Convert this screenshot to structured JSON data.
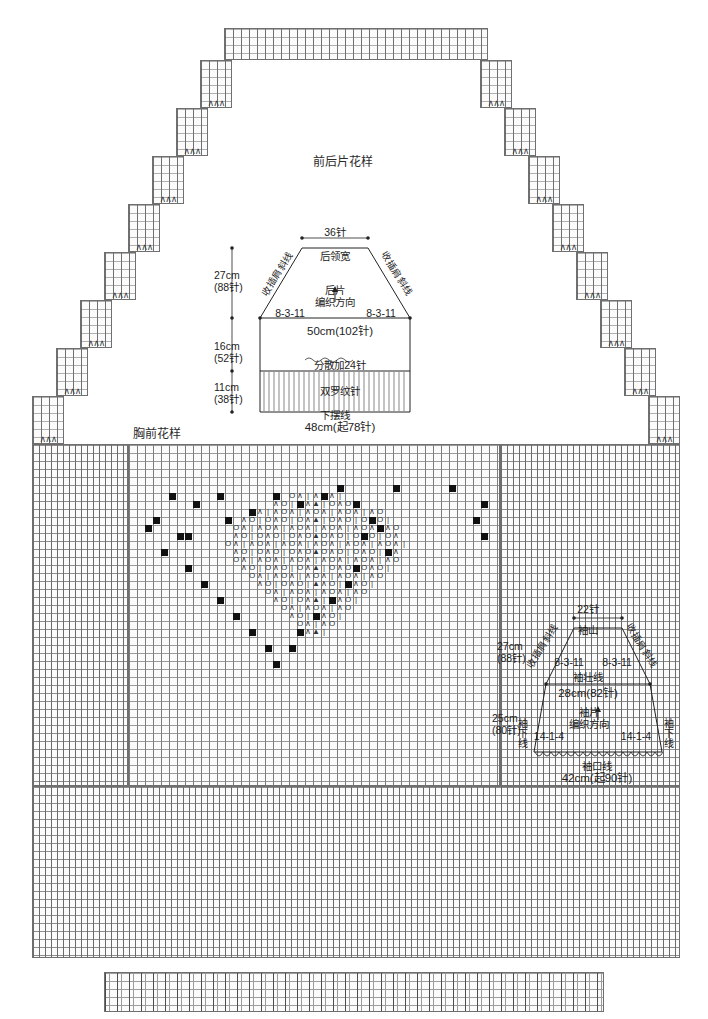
{
  "titles": {
    "body_pattern": "前后片花样",
    "chest_pattern": "胸前花样"
  },
  "back_piece": {
    "neck_width_stitches": "36针",
    "neck_label": "后领宽",
    "piece_name": "后片",
    "knit_direction": "编织方向",
    "raglan_left_label": "收插肩斜线",
    "raglan_right_label": "收插肩斜线",
    "dec_left": "8-3-11",
    "dec_right": "8-3-11",
    "chest_line": "50cm(102针)",
    "increase_note": "分散加24针",
    "rib_note": "双罗纹针",
    "hem_label": "下摆线",
    "hem_measure": "48cm(起78针)",
    "dim_yoke": "27cm\n(88针)",
    "dim_body": "16cm\n(52针)",
    "dim_rib": "11cm\n(38针)"
  },
  "sleeve": {
    "cap_top_stitches": "22针",
    "cap_label": "袖山",
    "raglan_left_label": "收插肩斜线",
    "raglan_right_label": "收插肩斜线",
    "dec_left": "8-3-11",
    "dec_right": "8-3-11",
    "upper_arm_label": "袖壮线",
    "upper_arm_measure": "28cm(82针)",
    "piece_name": "袖片",
    "knit_direction": "编织方向",
    "inc_left": "14-1-4",
    "inc_right": "14-1-4",
    "side_left_label": "袖下线",
    "side_right_label": "袖下线",
    "dim_cap": "27cm\n(88针)",
    "dim_arm": "25cm\n(80针)",
    "cuff_label": "袖口线",
    "cuff_measure": "42cm(起90针)"
  },
  "chart_data": {
    "type": "table",
    "symbols": {
      "decrease": "∧",
      "yarn_over": "O",
      "purl_decrease": "▲",
      "knit": "|",
      "bobble": "■"
    },
    "motif_rows": 27,
    "motif_cols": 46,
    "legend": [
      {
        "glyph": "■",
        "name": "bobble"
      },
      {
        "glyph": "O",
        "name": "yarn-over"
      },
      {
        "glyph": "∧",
        "name": "decrease"
      },
      {
        "glyph": "▲",
        "name": "double-decrease"
      },
      {
        "glyph": "|",
        "name": "knit-stitch"
      }
    ]
  }
}
